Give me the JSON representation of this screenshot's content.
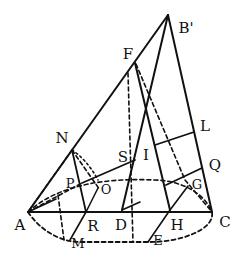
{
  "figure": {
    "ink_color": "#111111",
    "background": "#ffffff"
  },
  "labels": {
    "B": "B'",
    "F": "F",
    "N": "N",
    "L": "L",
    "S": "S",
    "I": "I",
    "Q": "Q",
    "P": "P",
    "O": "O",
    "G": "G",
    "A": "A",
    "R": "R",
    "D": "D",
    "H": "H",
    "C": "C",
    "M": "M",
    "E": "E"
  }
}
